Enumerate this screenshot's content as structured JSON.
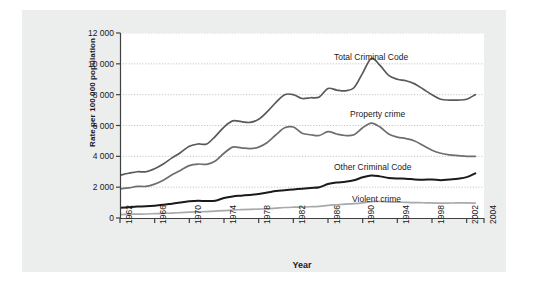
{
  "chart_data": {
    "type": "line",
    "title": "",
    "xlabel": "Year",
    "ylabel": "Rate per 100 000 population",
    "xlim": [
      1962,
      2004
    ],
    "ylim": [
      0,
      12000
    ],
    "grid": true,
    "legend_position": "inline-annotations",
    "yticks": [
      "0",
      "2 000",
      "4 000",
      "6 000",
      "8 000",
      "10 000",
      "12 000"
    ],
    "ytick_values": [
      0,
      2000,
      4000,
      6000,
      8000,
      10000,
      12000
    ],
    "xticks": [
      "1962",
      "1966",
      "1970",
      "1974",
      "1978",
      "1982",
      "1986",
      "1990",
      "1994",
      "1998",
      "2002",
      "2004"
    ],
    "xtick_values": [
      1962,
      1966,
      1970,
      1974,
      1978,
      1982,
      1986,
      1990,
      1994,
      1998,
      2002,
      2004
    ],
    "x": [
      1962,
      1963,
      1964,
      1965,
      1966,
      1967,
      1968,
      1969,
      1970,
      1971,
      1972,
      1973,
      1974,
      1975,
      1976,
      1977,
      1978,
      1979,
      1980,
      1981,
      1982,
      1983,
      1984,
      1985,
      1986,
      1987,
      1988,
      1989,
      1990,
      1991,
      1992,
      1993,
      1994,
      1995,
      1996,
      1997,
      1998,
      1999,
      2000,
      2001,
      2002,
      2003
    ],
    "series": [
      {
        "name": "Total Criminal Code",
        "color": "#58595b",
        "values": [
          2771,
          2900,
          3000,
          3000,
          3200,
          3500,
          3900,
          4250,
          4650,
          4800,
          4800,
          5300,
          5900,
          6300,
          6250,
          6200,
          6400,
          6900,
          7500,
          8000,
          8000,
          7750,
          7800,
          7850,
          8400,
          8300,
          8250,
          8450,
          9400,
          10340,
          9900,
          9250,
          9000,
          8900,
          8700,
          8350,
          8000,
          7700,
          7650,
          7650,
          7700,
          8000
        ]
      },
      {
        "name": "Property crime",
        "color": "#6d6e71",
        "values": [
          1891,
          1950,
          2050,
          2050,
          2200,
          2450,
          2800,
          3100,
          3400,
          3500,
          3480,
          3700,
          4200,
          4600,
          4550,
          4500,
          4600,
          4900,
          5400,
          5850,
          5900,
          5500,
          5400,
          5350,
          5600,
          5450,
          5350,
          5400,
          5850,
          6160,
          5900,
          5450,
          5250,
          5150,
          5000,
          4700,
          4400,
          4200,
          4100,
          4050,
          4000,
          4000
        ]
      },
      {
        "name": "Other Criminal Code",
        "color": "#1a1a1a",
        "values": [
          659,
          700,
          740,
          760,
          800,
          860,
          930,
          1000,
          1080,
          1120,
          1100,
          1120,
          1300,
          1400,
          1450,
          1500,
          1560,
          1650,
          1750,
          1800,
          1850,
          1900,
          1950,
          2000,
          2200,
          2300,
          2350,
          2450,
          2640,
          2760,
          2700,
          2600,
          2560,
          2550,
          2500,
          2480,
          2500,
          2450,
          2500,
          2550,
          2650,
          2900
        ]
      },
      {
        "name": "Violent crime",
        "color": "#a7a9ac",
        "values": [
          221,
          240,
          250,
          260,
          280,
          300,
          320,
          350,
          380,
          400,
          420,
          450,
          480,
          520,
          540,
          560,
          580,
          600,
          640,
          680,
          700,
          710,
          730,
          760,
          820,
          860,
          900,
          930,
          980,
          1060,
          1070,
          1040,
          1030,
          1010,
          1000,
          990,
          980,
          960,
          970,
          980,
          980,
          960
        ]
      }
    ],
    "annotations": [
      {
        "text": "Total Criminal Code",
        "x_px": 312,
        "y_px": 42
      },
      {
        "text": "Property crime",
        "x_px": 328,
        "y_px": 99
      },
      {
        "text": "Other Criminal Code",
        "x_px": 312,
        "y_px": 152
      },
      {
        "text": "Violent crime",
        "x_px": 330,
        "y_px": 184
      }
    ],
    "colors": {
      "panel_background": "#eceded",
      "plot_background": "#ffffff",
      "axis": "#404040",
      "gridline": "#b8b8b8"
    }
  }
}
